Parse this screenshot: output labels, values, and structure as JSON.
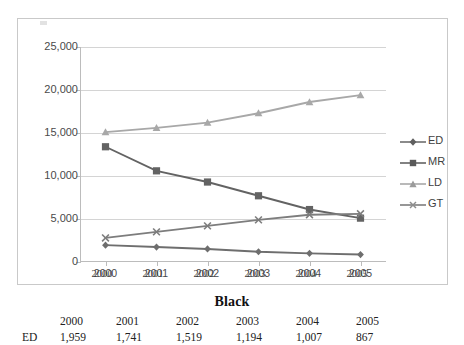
{
  "chart_data": {
    "type": "line",
    "title": "",
    "xlabel": "",
    "ylabel": "",
    "grid": true,
    "legend_position": "right",
    "ylim": [
      0,
      25000
    ],
    "categories": [
      "2000",
      "2001",
      "2002",
      "2003",
      "2004",
      "2005"
    ],
    "ytick_labels": [
      "0",
      "5,000",
      "10,000",
      "15,000",
      "20,000",
      "25,000"
    ],
    "ytick_values": [
      0,
      5000,
      10000,
      15000,
      20000,
      25000
    ],
    "series": [
      {
        "name": "ED",
        "marker": "diamond",
        "color": "#6e6e6e",
        "values": [
          1959,
          1741,
          1519,
          1194,
          1007,
          867
        ]
      },
      {
        "name": "MR",
        "marker": "square",
        "color": "#636363",
        "values": [
          13400,
          10600,
          9300,
          7700,
          6100,
          5100
        ]
      },
      {
        "name": "LD",
        "marker": "triangle",
        "color": "#a8a8a8",
        "values": [
          15100,
          15600,
          16200,
          17300,
          18600,
          19400
        ]
      },
      {
        "name": "GT",
        "marker": "cross",
        "color": "#7d7d7d",
        "values": [
          2800,
          3500,
          4200,
          4900,
          5500,
          5600
        ]
      }
    ]
  },
  "legend": {
    "items": [
      {
        "label": "ED",
        "marker": "diamond"
      },
      {
        "label": "MR",
        "marker": "square"
      },
      {
        "label": "LD",
        "marker": "triangle"
      },
      {
        "label": "GT",
        "marker": "cross"
      }
    ]
  },
  "axis_years_strip": [
    "2000",
    "2001",
    "2002",
    "2003",
    "2004",
    "2005"
  ],
  "bottom": {
    "title": "Black",
    "year_headers": [
      "2000",
      "2001",
      "2002",
      "2003",
      "2004",
      "2005"
    ],
    "row_label": "ED",
    "row_values": [
      "1,959",
      "1,741",
      "1,519",
      "1,194",
      "1,007",
      "867"
    ]
  }
}
